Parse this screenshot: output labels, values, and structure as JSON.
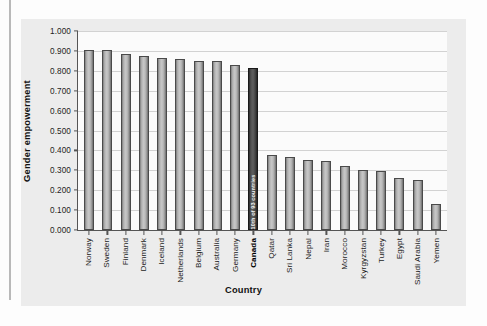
{
  "chart_data": {
    "type": "bar",
    "title": "",
    "xlabel": "Country",
    "ylabel": "Gender empowerment",
    "ylim": [
      0.0,
      1.0
    ],
    "ytick_step": 0.1,
    "grid": true,
    "legend": null,
    "categories": [
      "Norway",
      "Sweden",
      "Finland",
      "Denmark",
      "Iceland",
      "Netherlands",
      "Belgium",
      "Australia",
      "Germany",
      "Canada",
      "Qatar",
      "Sri Lanka",
      "Nepal",
      "Iran",
      "Morocco",
      "Kyrgyzstan",
      "Turkey",
      "Egypt",
      "Saudi Arabia",
      "Yemen"
    ],
    "values": [
      0.906,
      0.904,
      0.887,
      0.875,
      0.862,
      0.859,
      0.85,
      0.847,
      0.831,
      0.816,
      0.377,
      0.368,
      0.353,
      0.345,
      0.324,
      0.303,
      0.298,
      0.262,
      0.253,
      0.13
    ],
    "ytick_labels": [
      "1.000",
      "0.900",
      "0.800",
      "0.700",
      "0.600",
      "0.500",
      "0.400",
      "0.300",
      "0.200",
      "0.100",
      "0.000"
    ],
    "ytick_values": [
      1.0,
      0.9,
      0.8,
      0.7,
      0.6,
      0.5,
      0.4,
      0.3,
      0.2,
      0.1,
      0.0
    ],
    "highlight_category": "Canada",
    "annotations": [
      {
        "category": "Canada",
        "text": "10th of 93 countries"
      }
    ],
    "colors": {
      "bar_fill": "#c8c8c8",
      "bar_edge": "#4a4a4a",
      "highlight_fill": "#5e5e5e",
      "highlight_edge": "#1a1a1a",
      "plot_background": "#fbfbfb",
      "figure_background": "#ececec",
      "gridline": "#d2d2d2",
      "axis": "#555555",
      "text": "#1c1c1c"
    }
  }
}
